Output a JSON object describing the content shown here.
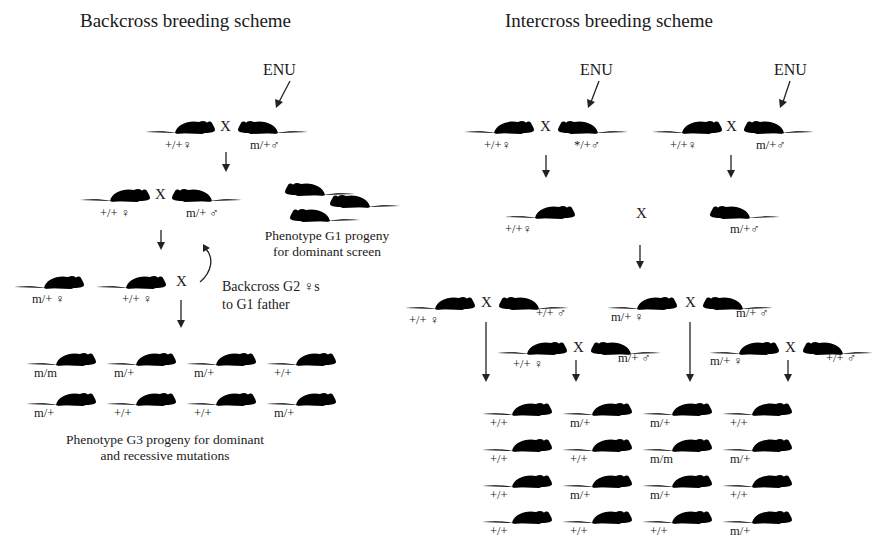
{
  "backcross": {
    "title": "Backcross breeding scheme",
    "enu": "ENU",
    "x_symbol": "X",
    "g0": {
      "female": "+/+♀",
      "male": "m/+♂"
    },
    "g1": {
      "female": "+/+ ♀",
      "male": "m/+ ♂"
    },
    "g1_screen_caption": [
      "Phenotype G1 progeny",
      "for dominant screen"
    ],
    "g2": {
      "female_a": "m/+ ♀",
      "female_b": "+/+ ♀"
    },
    "backcross_note": [
      "Backcross G2 ♀s",
      "to G1 father"
    ],
    "g3": [
      [
        "m/m",
        "m/+",
        "m/+",
        "+/+"
      ],
      [
        "m/+",
        "+/+",
        "+/+",
        "m/+"
      ]
    ],
    "g3_caption": [
      "Phenotype G3 progeny for dominant",
      "and recessive mutations"
    ]
  },
  "intercross": {
    "title": "Intercross breeding scheme",
    "enu_left": "ENU",
    "enu_right": "ENU",
    "x_symbol": "X",
    "g0_left": {
      "female": "+/+♀",
      "male": "*/+♂"
    },
    "g0_right": {
      "female": "+/+♀",
      "male": "m/+♂"
    },
    "g1": {
      "female": "+/+♀",
      "male": "m/+♂"
    },
    "g2_crosses": [
      {
        "female": "+/+ ♀",
        "male": "+/+ ♂"
      },
      {
        "female": "+/+ ♀",
        "male": "m/+ ♂"
      },
      {
        "female": "m/+ ♀",
        "male": "m/+ ♂"
      },
      {
        "female": "m/+ ♀",
        "male": "+/+ ♂"
      }
    ],
    "g3": [
      [
        "+/+",
        "m/+",
        "m/+",
        "+/+"
      ],
      [
        "+/+",
        "+/+",
        "m/m",
        "m/+"
      ],
      [
        "+/+",
        "m/+",
        "m/+",
        "+/+"
      ],
      [
        "+/+",
        "+/+",
        "+/+",
        "m/+"
      ]
    ]
  }
}
